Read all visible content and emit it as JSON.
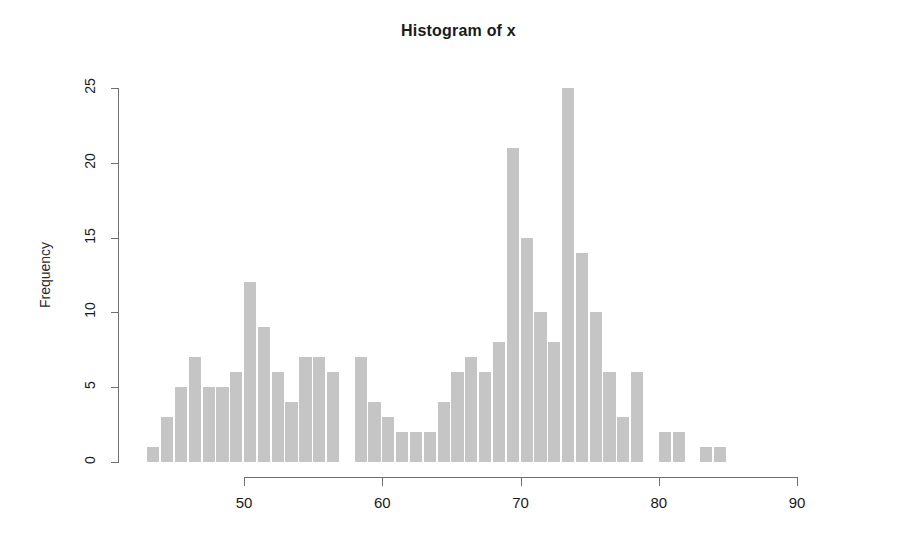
{
  "chart_data": {
    "type": "bar",
    "title": "Histogram of x",
    "xlabel": "",
    "ylabel": "Frequency",
    "grid": false,
    "legend": null,
    "xlim": [
      43,
      96
    ],
    "ylim": [
      0,
      25
    ],
    "bin_width": 1,
    "xticks": [
      "50",
      "60",
      "70",
      "80",
      "90"
    ],
    "xtick_values": [
      50,
      60,
      70,
      80,
      90
    ],
    "yticks": [
      "0",
      "5",
      "10",
      "15",
      "20",
      "25"
    ],
    "ytick_values": [
      0,
      5,
      10,
      15,
      20,
      25
    ],
    "bar_color": "#c5c5c5",
    "axis_color": "#6f6f6f",
    "bin_starts": [
      43,
      44,
      45,
      46,
      47,
      48,
      49,
      50,
      51,
      52,
      53,
      54,
      55,
      56,
      57,
      58,
      59,
      60,
      61,
      62,
      63,
      64,
      65,
      66,
      67,
      68,
      69,
      70,
      71,
      72,
      73,
      74,
      75,
      76,
      77,
      78,
      79,
      80,
      81,
      82,
      83,
      84,
      85,
      86,
      87,
      88,
      89,
      90,
      91,
      92,
      93,
      94,
      95
    ],
    "categories": [
      "43",
      "44",
      "45",
      "46",
      "47",
      "48",
      "49",
      "50",
      "51",
      "52",
      "53",
      "54",
      "55",
      "56",
      "57",
      "58",
      "59",
      "60",
      "61",
      "62",
      "63",
      "64",
      "65",
      "66",
      "67",
      "68",
      "69",
      "70",
      "71",
      "72",
      "73",
      "74",
      "75",
      "76",
      "77",
      "78",
      "79",
      "80",
      "81",
      "82",
      "83",
      "84",
      "85",
      "86",
      "87",
      "88",
      "89",
      "90",
      "91",
      "92",
      "93",
      "94",
      "95"
    ],
    "values": [
      1,
      3,
      5,
      7,
      5,
      5,
      6,
      12,
      9,
      6,
      4,
      7,
      7,
      6,
      0,
      7,
      4,
      3,
      2,
      2,
      2,
      4,
      6,
      7,
      6,
      8,
      21,
      15,
      10,
      8,
      25,
      14,
      10,
      6,
      3,
      6,
      0,
      2,
      2,
      0,
      1,
      1,
      0,
      0,
      0,
      0,
      0,
      0,
      0,
      0,
      0,
      0,
      0
    ]
  }
}
